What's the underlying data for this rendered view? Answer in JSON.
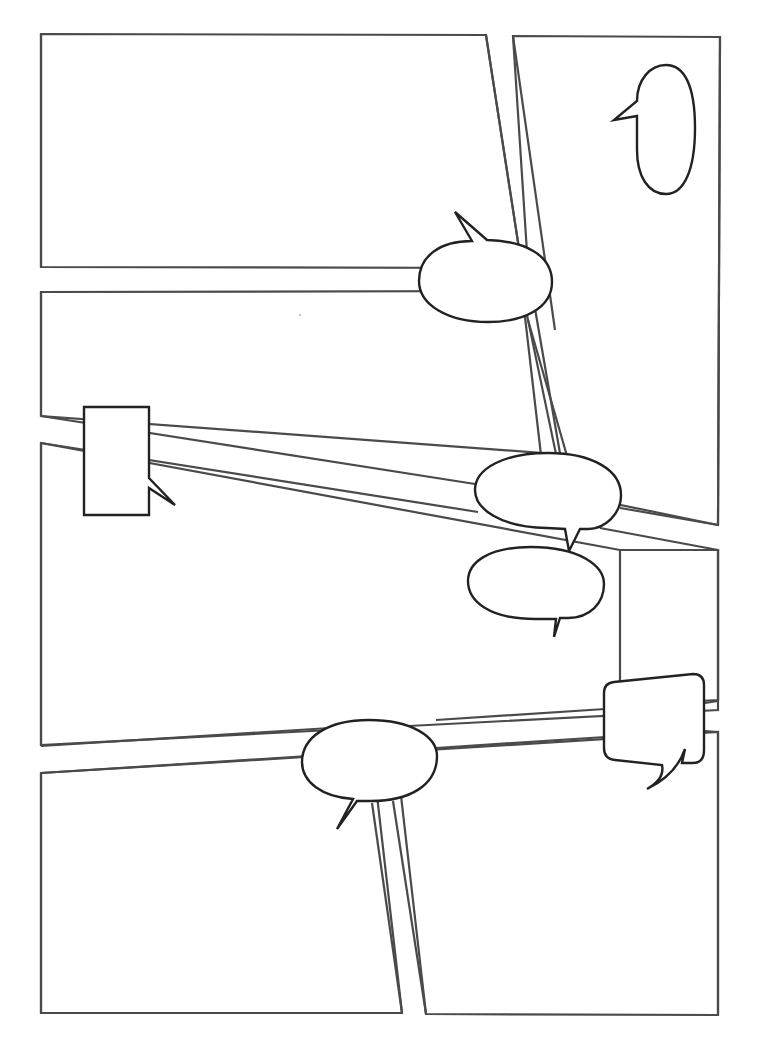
{
  "page": {
    "width": 762,
    "height": 1059,
    "background": "#ffffff",
    "panel_stroke": "#4a4a4a",
    "bubble_stroke": "#222222"
  },
  "panels": [
    {
      "id": "panel-1",
      "label": "Panel 1 (top left)"
    },
    {
      "id": "panel-2",
      "label": "Panel 2 (top right, tall)"
    },
    {
      "id": "panel-3",
      "label": "Panel 3 (middle left)"
    },
    {
      "id": "panel-4",
      "label": "Panel 4 (center wide)"
    },
    {
      "id": "panel-5",
      "label": "Panel 5 (right middle)"
    },
    {
      "id": "panel-6",
      "label": "Panel 6 (bottom left)"
    },
    {
      "id": "panel-7",
      "label": "Panel 7 (bottom right)"
    }
  ],
  "bubbles": [
    {
      "id": "bubble-tall-oval",
      "shape": "tall oval speech bubble",
      "text": ""
    },
    {
      "id": "bubble-top-oval",
      "shape": "oval speech bubble",
      "text": ""
    },
    {
      "id": "bubble-rect-caption",
      "shape": "rectangular caption box",
      "text": ""
    },
    {
      "id": "bubble-center-upper",
      "shape": "oval speech bubble",
      "text": ""
    },
    {
      "id": "bubble-center-lower",
      "shape": "oval speech bubble",
      "text": ""
    },
    {
      "id": "bubble-rounded-square",
      "shape": "rounded square speech bubble",
      "text": ""
    },
    {
      "id": "bubble-bottom-oval",
      "shape": "oval speech bubble",
      "text": ""
    }
  ]
}
